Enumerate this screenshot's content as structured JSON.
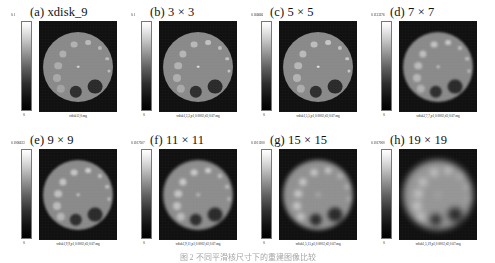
{
  "figure": {
    "caption": "图 2 不同平滑核尺寸下的重建图像比较",
    "panels": [
      {
        "id": "a",
        "title": "(a) xdisk_9",
        "cbar_max": "0.1",
        "cbar_min": "0",
        "filename": "xdisk12,0.mg",
        "blur": 0.0,
        "disk_level": "#8d8d8d"
      },
      {
        "id": "b",
        "title": "(b) 3 × 3",
        "cbar_max": "0.1",
        "cbar_min": "0",
        "filename": "xdisk1,3,3,p1,0.0002,d2,0.67.mg",
        "blur": 0.45,
        "disk_level": "#8d8d8d"
      },
      {
        "id": "c",
        "title": "(c) 5 × 5",
        "cbar_max": "0.166666",
        "cbar_min": "0",
        "filename": "xdisk1,5,5,p1,0.0002,d2,0.67.mg",
        "blur": 0.75,
        "disk_level": "#8d8d8d"
      },
      {
        "id": "d",
        "title": "(d) 7 × 7",
        "cbar_max": "0.1133276",
        "cbar_min": "0",
        "filename": "xdisk2,7,7,p1,0.0002,d2,0.67.mg",
        "blur": 1.0,
        "disk_level": "#8d8d8d"
      },
      {
        "id": "e",
        "title": "(e) 9 × 9",
        "cbar_max": "0.1006623",
        "cbar_min": "0",
        "filename": "xdisk1,9,9,p1,0.0002,d2,0.67.mg",
        "blur": 1.3,
        "disk_level": "#8d8d8d"
      },
      {
        "id": "f",
        "title": "(f) 11 × 11",
        "cbar_max": "0.1107507",
        "cbar_min": "0",
        "filename": "xdisk1,9,11,p1,0.0002,d2,0.67.mg",
        "blur": 1.7,
        "disk_level": "#909090"
      },
      {
        "id": "g",
        "title": "(g) 15 × 15",
        "cbar_max": "0.1101200",
        "cbar_min": "0",
        "filename": "xdisk1,5,15,p1,0.0002,d2,0.67.mg",
        "blur": 2.2,
        "disk_level": "#949494"
      },
      {
        "id": "h",
        "title": "(h) 19 × 19",
        "cbar_max": "0.1017000",
        "cbar_min": "0",
        "filename": "xdisk1,5,19,p1,0.0002,d2,0.67.mg",
        "blur": 3.0,
        "disk_level": "#9a9a9a"
      }
    ],
    "phantom": {
      "bright_dots": [
        {
          "x": 31,
          "y": 13,
          "r": 3.4,
          "c": "#b8b8b8"
        },
        {
          "x": 45,
          "y": 11,
          "r": 2.9,
          "c": "#c0c0c0"
        },
        {
          "x": 57,
          "y": 16,
          "r": 2.1,
          "c": "#bdbdbd"
        },
        {
          "x": 20,
          "y": 22,
          "r": 3.6,
          "c": "#b5b5b5"
        },
        {
          "x": 64,
          "y": 27,
          "r": 1.8,
          "c": "#c2c2c2"
        },
        {
          "x": 15,
          "y": 34,
          "r": 3.8,
          "c": "#b2b2b2"
        },
        {
          "x": 66,
          "y": 39,
          "r": 1.5,
          "c": "#c4c4c4"
        },
        {
          "x": 14,
          "y": 46,
          "r": 4.0,
          "c": "#aeaeae"
        },
        {
          "x": 35,
          "y": 35,
          "r": 1.3,
          "c": "#dcdcdc"
        },
        {
          "x": 18,
          "y": 57,
          "r": 4.2,
          "c": "#a8a8a8"
        }
      ],
      "dark_dots": [
        {
          "x": 33,
          "y": 60,
          "r": 6.2,
          "c": "#2a2a2a"
        },
        {
          "x": 52,
          "y": 55,
          "r": 7.4,
          "c": "#262626"
        }
      ]
    }
  }
}
